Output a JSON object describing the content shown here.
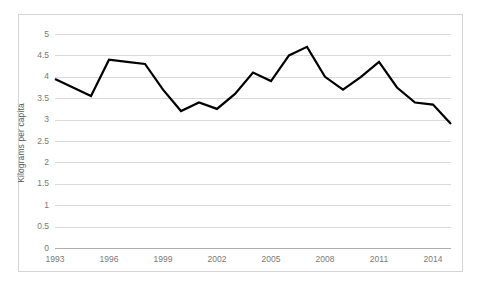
{
  "chart_data": {
    "type": "line",
    "title": "",
    "subtitle": "",
    "xlabel": "",
    "ylabel": "Kilograms per capita",
    "ylim": [
      0,
      5
    ],
    "ytick_labels": [
      "5",
      "4.5",
      "4",
      "3.5",
      "3",
      "2.5",
      "2",
      "1.5",
      "1",
      "0.5",
      "0"
    ],
    "ytick_values": [
      5,
      4.5,
      4,
      3.5,
      3,
      2.5,
      2,
      1.5,
      1,
      0.5,
      0
    ],
    "xtick_labels": [
      "1993",
      "1996",
      "1999",
      "2002",
      "2005",
      "2008",
      "2011",
      "2014"
    ],
    "xtick_values": [
      1993,
      1996,
      1999,
      2002,
      2005,
      2008,
      2011,
      2014
    ],
    "xlim": [
      1993,
      2015
    ],
    "grid": "horizontal",
    "legend": "none",
    "line_color": "#000000",
    "line_width": 2.2,
    "markers": "none",
    "x": [
      1993,
      1994,
      1995,
      1996,
      1997,
      1998,
      1999,
      2000,
      2001,
      2002,
      2003,
      2004,
      2005,
      2006,
      2007,
      2008,
      2009,
      2010,
      2011,
      2012,
      2013,
      2014,
      2015
    ],
    "values": [
      3.95,
      3.75,
      3.55,
      4.4,
      4.35,
      4.3,
      3.7,
      3.2,
      3.4,
      3.25,
      3.6,
      4.1,
      3.9,
      4.5,
      4.7,
      4.0,
      3.7,
      4.0,
      4.35,
      3.75,
      3.4,
      3.35,
      2.9
    ],
    "series": [
      {
        "name": "Kilograms per capita",
        "values": [
          3.95,
          3.75,
          3.55,
          4.4,
          4.35,
          4.3,
          3.7,
          3.2,
          3.4,
          3.25,
          3.6,
          4.1,
          3.9,
          4.5,
          4.7,
          4.0,
          3.7,
          4.0,
          4.35,
          3.75,
          3.4,
          3.35,
          2.9
        ]
      }
    ]
  },
  "colors": {
    "line": "#000000",
    "gridline": "#d9d9d9",
    "axis": "#b0b0b0",
    "tick_text": "#7a7a7a",
    "axis_title_text": "#595959",
    "frame_border": "#d4d4d4",
    "background": "#ffffff"
  }
}
